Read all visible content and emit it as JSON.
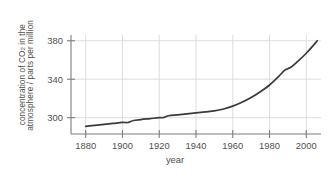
{
  "chart_data": {
    "type": "line",
    "title": "",
    "xlabel": "year",
    "ylabel_line1": "concentration of CO",
    "ylabel_line1_sub": "2",
    "ylabel_line1_tail": " in the",
    "ylabel_line2": "atmosphere / parts per million",
    "ylabel_full": "concentration of CO2 in the atmosphere / parts per million",
    "xlim": [
      1872,
      2008
    ],
    "ylim": [
      283,
      386
    ],
    "xticks": [
      1880,
      1900,
      1920,
      1940,
      1960,
      1980,
      2000
    ],
    "xtick_labels": [
      "1880",
      "1900",
      "1920",
      "1940",
      "1960",
      "1980",
      "2000"
    ],
    "yticks": [
      300,
      340,
      380
    ],
    "ytick_labels": [
      "300",
      "340",
      "380"
    ],
    "grid": true,
    "legend": "none",
    "line_color": "#3a3a3a",
    "grid_color": "#d9d9d9",
    "axis_color": "#7d7d7d",
    "text_color": "#4f4f4f",
    "series": [
      {
        "name": "atmospheric CO2 concentration",
        "x": [
          1880,
          1885,
          1890,
          1895,
          1900,
          1903,
          1906,
          1910,
          1915,
          1920,
          1922,
          1925,
          1930,
          1935,
          1940,
          1945,
          1950,
          1955,
          1960,
          1965,
          1970,
          1975,
          1980,
          1985,
          1988,
          1990,
          1992,
          1995,
          2000,
          2006
        ],
        "y": [
          291,
          292,
          293,
          294,
          295,
          295,
          297,
          298,
          299,
          300,
          300,
          302,
          303,
          304,
          305,
          306,
          307,
          309,
          312,
          316,
          321,
          327,
          334,
          343,
          349,
          351,
          353,
          358,
          367,
          380
        ]
      }
    ]
  }
}
